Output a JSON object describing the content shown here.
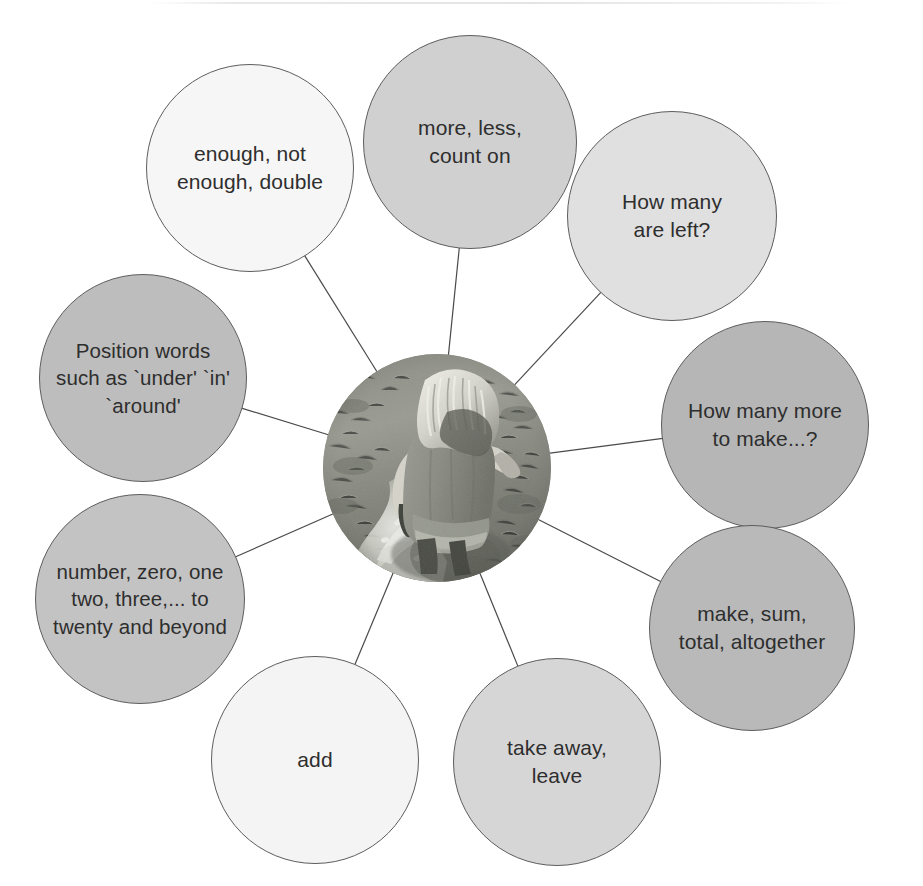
{
  "page": {
    "width": 923,
    "height": 886,
    "background_color": "#ffffff",
    "outline_color": "#5d5d5d",
    "text_color": "#2e2e2e",
    "connector_color": "#4a4a4a"
  },
  "center": {
    "name": "child-splashing-in-puddle-photo",
    "description": "Black and white photograph of a young child with long hair, seen from behind, jumping and splashing in a puddle on grass",
    "shape": "circle",
    "cx": 437,
    "cy": 468,
    "r": 114,
    "palette": {
      "grass_dark": "#6f7168",
      "grass_mid": "#8d8f86",
      "grass_light": "#adafa6",
      "water_highlight": "#f0f0ec",
      "clothing": "#8a8c84",
      "skin": "#d8d6cc",
      "hair": "#e9e7df"
    }
  },
  "bubbles": [
    {
      "id": "more-less-count-on",
      "label": "more, less,\ncount on",
      "cx": 470,
      "cy": 142,
      "r": 107,
      "fill": "#d0d0d0",
      "font_size": 21
    },
    {
      "id": "how-many-are-left",
      "label": "How many\nare left?",
      "cx": 672,
      "cy": 216,
      "r": 105,
      "fill": "#e0e0e0",
      "font_size": 21
    },
    {
      "id": "how-many-more-to-make",
      "label": "How many more\nto make...?",
      "cx": 765,
      "cy": 425,
      "r": 104,
      "fill": "#b6b6b6",
      "font_size": 21
    },
    {
      "id": "make-sum-total-altogether",
      "label": "make, sum,\ntotal, altogether",
      "cx": 752,
      "cy": 628,
      "r": 103,
      "fill": "#b9b9b9",
      "font_size": 21
    },
    {
      "id": "take-away-leave",
      "label": "take away,\nleave",
      "cx": 557,
      "cy": 762,
      "r": 104,
      "fill": "#d6d6d6",
      "font_size": 21
    },
    {
      "id": "add",
      "label": "add",
      "cx": 315,
      "cy": 760,
      "r": 104,
      "fill": "#f4f4f4",
      "font_size": 21
    },
    {
      "id": "number-zero-one-two-three",
      "label": "number, zero, one\ntwo, three,... to\ntwenty and beyond",
      "cx": 140,
      "cy": 599,
      "r": 105,
      "fill": "#c3c3c3",
      "font_size": 20.5
    },
    {
      "id": "position-words",
      "label": "Position words\nsuch as `under' `in'\n`around'",
      "cx": 143,
      "cy": 378,
      "r": 104,
      "fill": "#bdbdbd",
      "font_size": 20.5
    },
    {
      "id": "enough-not-enough-double",
      "label": "enough, not\nenough, double",
      "cx": 250,
      "cy": 168,
      "r": 104,
      "fill": "#f6f6f6",
      "font_size": 21
    }
  ],
  "connectors": [
    {
      "id": "connector-more-less",
      "to": "more-less-count-on"
    },
    {
      "id": "connector-how-many-left",
      "to": "how-many-are-left"
    },
    {
      "id": "connector-how-many-more",
      "to": "how-many-more-to-make"
    },
    {
      "id": "connector-make-sum",
      "to": "make-sum-total-altogether"
    },
    {
      "id": "connector-take-away",
      "to": "take-away-leave"
    },
    {
      "id": "connector-add",
      "to": "add"
    },
    {
      "id": "connector-number-zero",
      "to": "number-zero-one-two-three"
    },
    {
      "id": "connector-position-words",
      "to": "position-words"
    },
    {
      "id": "connector-enough",
      "to": "enough-not-enough-double"
    }
  ]
}
